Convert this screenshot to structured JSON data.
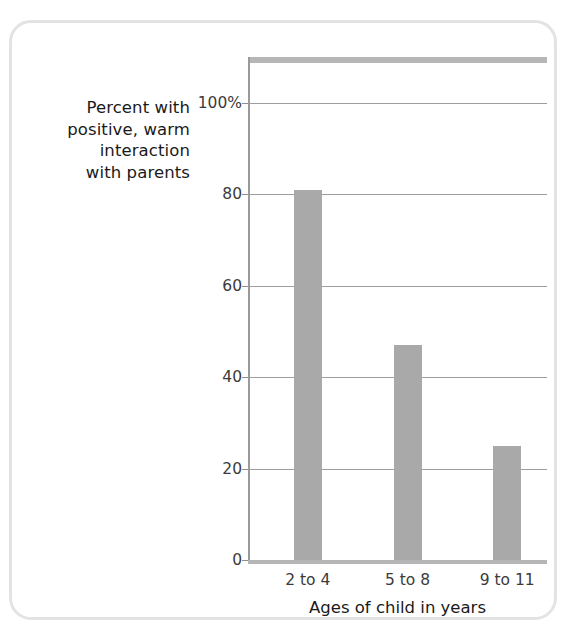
{
  "chart_data": {
    "type": "bar",
    "title": "",
    "subtitle": "",
    "categories": [
      "2 to 4",
      "5 to 8",
      "9 to 11"
    ],
    "values": [
      81,
      47,
      25
    ],
    "xlabel": "Ages of child in years",
    "ylabel": "Percent with positive, warm interaction with parents",
    "ylabel_lines": [
      "Percent with",
      "positive, warm",
      "interaction",
      "with parents"
    ],
    "ylim": [
      0,
      110
    ],
    "yticks": [
      0,
      20,
      40,
      60,
      80,
      100
    ],
    "ytick_labels": [
      "0",
      "20",
      "40",
      "60",
      "80",
      "100%"
    ],
    "grid": true,
    "legend": false,
    "legend_position": "none",
    "colors": {
      "bar": "#a9a9a9",
      "gridline": "#9d9d9d",
      "axis": "#9a9a9a",
      "top_band": "#b6b6b6",
      "card_border": "#e3e3e3",
      "text": "#1a1a1a",
      "tick_text": "#3b3b3b",
      "background": "#ffffff"
    }
  },
  "axis": {
    "y_title_lines": [
      "Percent with",
      "positive, warm",
      "interaction",
      "with parents"
    ],
    "x_title": "Ages of child in years",
    "y_ticks": [
      {
        "label": "100%",
        "value": 100
      },
      {
        "label": "80",
        "value": 80
      },
      {
        "label": "60",
        "value": 60
      },
      {
        "label": "40",
        "value": 40
      },
      {
        "label": "20",
        "value": 20
      },
      {
        "label": "0",
        "value": 0
      }
    ],
    "x_ticks": [
      {
        "label": "2 to 4"
      },
      {
        "label": "5 to 8"
      },
      {
        "label": "9 to 11"
      }
    ]
  },
  "bars": [
    {
      "category": "2 to 4",
      "value": 81
    },
    {
      "category": "5 to 8",
      "value": 47
    },
    {
      "category": "9 to 11",
      "value": 25
    }
  ]
}
